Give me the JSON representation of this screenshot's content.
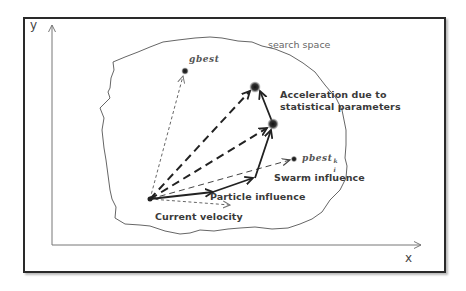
{
  "axes": {
    "y_label": "y",
    "x_label": "x"
  },
  "region": {
    "label": "search space"
  },
  "points": {
    "gbest": "gbest",
    "pbest": "pbest",
    "pbest_sup": "k",
    "pbest_sub": "i"
  },
  "annotations": {
    "acceleration_line1": "Acceleration due to",
    "acceleration_line2": "statistical parameters",
    "swarm_influence": "Swarm influence",
    "particle_influence": "Particle influence",
    "current_velocity": "Current velocity"
  },
  "colors": {
    "frame": "#2a2a2a",
    "axis": "#777777",
    "boundary": "#666666",
    "vector": "#222222",
    "thin_dashed": "#555555"
  }
}
